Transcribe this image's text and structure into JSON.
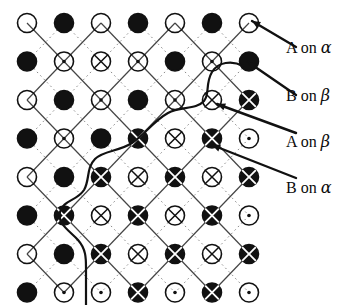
{
  "figure": {
    "type": "lattice-diagram",
    "background_color": "#ffffff",
    "ink_color": "#111111",
    "solid_bond_color": "#444444",
    "dotted_bond_color": "#888888"
  },
  "legend": {
    "items": [
      {
        "id": "a-on-alpha",
        "label": "A on α",
        "text_plain": "A on",
        "greek": "α",
        "symbol": "open-circle-plain",
        "arrow_target": "r0c6"
      },
      {
        "id": "b-on-beta",
        "label": "B on β",
        "text_plain": "B on",
        "greek": "β",
        "symbol": "filled-circle-plain",
        "arrow_target": "r1c6"
      },
      {
        "id": "a-on-beta",
        "label": "A on β",
        "text_plain": "A on",
        "greek": "β",
        "symbol": "open-circle-cross",
        "arrow_target": "r2c5"
      },
      {
        "id": "b-on-alpha",
        "label": "B on α",
        "text_plain": "B on",
        "greek": "α",
        "symbol": "filled-circle-cross",
        "arrow_target": "r3c5"
      }
    ]
  },
  "symbols": {
    "open-circle-plain": {
      "fill": "none",
      "stroke": "#111111",
      "marker": "none"
    },
    "open-circle-dot": {
      "fill": "none",
      "stroke": "#111111",
      "marker": "dot"
    },
    "open-circle-cross": {
      "fill": "none",
      "stroke": "#111111",
      "marker": "cross"
    },
    "filled-circle-plain": {
      "fill": "#111111",
      "stroke": "#111111",
      "marker": "none"
    },
    "filled-circle-cross": {
      "fill": "#111111",
      "stroke": "#111111",
      "marker": "cross-light"
    }
  },
  "grid": {
    "origin_x": 27,
    "origin_y": 23,
    "step_x": 37,
    "step_y": 38.5,
    "cols": 7,
    "rows": 8,
    "radius": 9.5
  },
  "lattice_rows": [
    [
      "open-circle-plain",
      "filled-circle-plain",
      "open-circle-plain",
      "filled-circle-plain",
      "open-circle-plain",
      "filled-circle-plain",
      "open-circle-plain"
    ],
    [
      "filled-circle-plain",
      "open-circle-dot",
      "open-circle-cross",
      "open-circle-dot",
      "filled-circle-plain",
      "open-circle-dot",
      "filled-circle-plain"
    ],
    [
      "open-circle-plain",
      "filled-circle-plain",
      "open-circle-dot",
      "filled-circle-plain",
      "open-circle-dot",
      "open-circle-cross",
      "filled-circle-cross"
    ],
    [
      "filled-circle-plain",
      "open-circle-dot",
      "filled-circle-plain",
      "filled-circle-cross",
      "open-circle-cross",
      "filled-circle-cross",
      "open-circle-dot"
    ],
    [
      "open-circle-plain",
      "filled-circle-plain",
      "filled-circle-cross",
      "open-circle-cross",
      "filled-circle-cross",
      "open-circle-cross",
      "filled-circle-cross"
    ],
    [
      "filled-circle-plain",
      "filled-circle-cross",
      "open-circle-cross",
      "filled-circle-cross",
      "open-circle-cross",
      "filled-circle-cross",
      "open-circle-dot"
    ],
    [
      "open-circle-plain",
      "filled-circle-plain",
      "filled-circle-cross",
      "open-circle-cross",
      "filled-circle-cross",
      "open-circle-cross",
      "filled-circle-cross"
    ],
    [
      "filled-circle-plain",
      "open-circle-dot",
      "open-circle-dot",
      "filled-circle-cross",
      "open-circle-dot",
      "filled-circle-cross",
      "open-circle-dot"
    ]
  ],
  "boundary_curve": {
    "name": "antiphase-boundary",
    "stroke": "#111111",
    "width": 2.2,
    "path": "M 243 66 C 232 60 218 62 212 72 C 205 84 210 94 204 101 C 196 110 180 106 168 113 C 152 122 146 134 132 143 C 118 152 104 150 95 159 C 86 168 90 180 84 190 C 77 201 63 200 60 212 C 57 224 70 231 78 240 C 86 249 86 258 86 268 C 86 281 86 292 86 305"
  },
  "arrows": {
    "stroke": "#111111",
    "width": 2.4,
    "head_size": 9,
    "items": [
      {
        "id": "arrow-a-on-alpha",
        "from_x": 296,
        "from_y": 47,
        "to_x": 252,
        "to_y": 21
      },
      {
        "id": "arrow-b-on-beta",
        "from_x": 296,
        "from_y": 95,
        "to_x": 248,
        "to_y": 62
      },
      {
        "id": "arrow-a-on-beta",
        "from_x": 296,
        "from_y": 133,
        "to_x": 217,
        "to_y": 104
      },
      {
        "id": "arrow-b-on-alpha",
        "from_x": 296,
        "from_y": 178,
        "to_x": 212,
        "to_y": 145
      }
    ]
  },
  "legend_positions": [
    38,
    86,
    132,
    178
  ]
}
